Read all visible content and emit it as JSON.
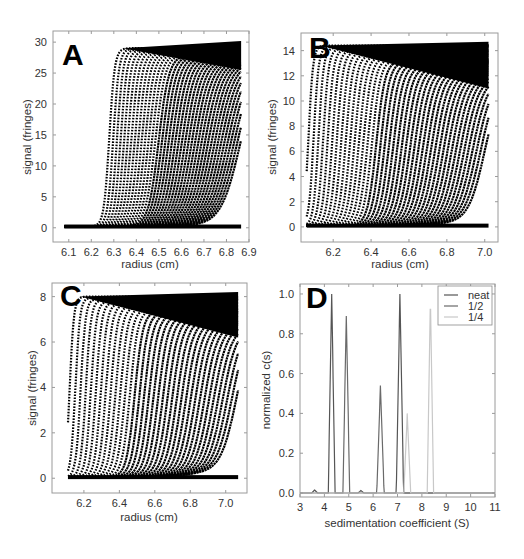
{
  "figure": {
    "panels": [
      "A",
      "B",
      "C",
      "D"
    ]
  },
  "chart_data": [
    {
      "panel": "A",
      "type": "scatter",
      "title": "",
      "panel_label": "A",
      "xlabel": "radius (cm)",
      "ylabel": "signal (fringes)",
      "xlim": [
        6.03,
        6.9
      ],
      "ylim": [
        -2.3,
        31.8
      ],
      "xticks": [
        "6.1",
        "6.2",
        "6.3",
        "6.4",
        "6.5",
        "6.6",
        "6.7",
        "6.8",
        "6.9"
      ],
      "yticks": [
        "0",
        "5",
        "10",
        "15",
        "20",
        "25",
        "30"
      ],
      "grid": false,
      "description": "Interference sedimentation velocity scans; ~40 boundary scans moving outward",
      "n_scans": 40,
      "meniscus": 6.08,
      "cell_bottom": 6.865,
      "first_boundary": 6.28,
      "last_boundary": 6.86,
      "plateau_start": 29.0,
      "plateau_end": 25.5,
      "plateau_max_bottom": 30.2,
      "baseline": 0.2
    },
    {
      "panel": "B",
      "type": "scatter",
      "panel_label": "B",
      "xlabel": "radius (cm)",
      "ylabel": "signal (fringes)",
      "xlim": [
        6.03,
        7.07
      ],
      "ylim": [
        -1.2,
        15.4
      ],
      "xticks": [
        "6.2",
        "6.4",
        "6.6",
        "6.8",
        "7.0"
      ],
      "yticks": [
        "0",
        "2",
        "4",
        "6",
        "8",
        "10",
        "12",
        "14"
      ],
      "grid": false,
      "n_scans": 42,
      "meniscus": 6.06,
      "cell_bottom": 7.02,
      "first_boundary": 6.07,
      "last_boundary": 7.0,
      "plateau_start": 14.4,
      "plateau_end": 11.0,
      "plateau_max_bottom": 14.7,
      "baseline": 0.1
    },
    {
      "panel": "C",
      "type": "scatter",
      "panel_label": "C",
      "xlabel": "radius (cm)",
      "ylabel": "signal (fringes)",
      "xlim": [
        6.02,
        7.12
      ],
      "ylim": [
        -0.65,
        8.6
      ],
      "xticks": [
        "6.2",
        "6.4",
        "6.6",
        "6.8",
        "7.0"
      ],
      "yticks": [
        "0",
        "2",
        "4",
        "6",
        "8"
      ],
      "grid": false,
      "n_scans": 36,
      "meniscus": 6.11,
      "cell_bottom": 7.07,
      "first_boundary": 6.12,
      "last_boundary": 7.06,
      "plateau_start": 8.0,
      "plateau_end": 6.2,
      "plateau_max_bottom": 8.2,
      "baseline": 0.05
    },
    {
      "panel": "D",
      "type": "line",
      "panel_label": "D",
      "xlabel": "sedimentation coefficient (S)",
      "ylabel": "normalized c(s)",
      "xlim": [
        3,
        11
      ],
      "ylim": [
        -0.02,
        1.05
      ],
      "xticks": [
        "3",
        "4",
        "5",
        "6",
        "7",
        "8",
        "9",
        "10",
        "11"
      ],
      "yticks": [
        "0.0",
        "0.2",
        "0.4",
        "0.6",
        "0.8",
        "1.0"
      ],
      "grid": false,
      "legend_position": "upper right",
      "series": [
        {
          "name": "neat",
          "color": "#555555",
          "peaks": [
            {
              "s": 3.6,
              "height": 0.015,
              "width": 0.12
            },
            {
              "s": 4.3,
              "height": 1.0,
              "width": 0.14
            },
            {
              "s": 5.5,
              "height": 0.012,
              "width": 0.12
            },
            {
              "s": 7.1,
              "height": 1.0,
              "width": 0.15
            }
          ]
        },
        {
          "name": "1/2",
          "color": "#6a6a6a",
          "peaks": [
            {
              "s": 4.9,
              "height": 0.89,
              "width": 0.14
            },
            {
              "s": 6.3,
              "height": 0.54,
              "width": 0.15
            }
          ]
        },
        {
          "name": "1/4",
          "color": "#c8c8c8",
          "peaks": [
            {
              "s": 7.4,
              "height": 0.4,
              "width": 0.14
            },
            {
              "s": 8.35,
              "height": 1.0,
              "width": 0.13
            }
          ]
        }
      ]
    }
  ]
}
